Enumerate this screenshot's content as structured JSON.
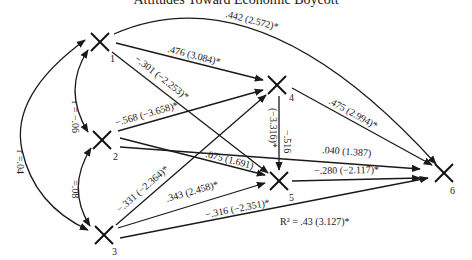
{
  "title": "Attitudes Toward Economic Boycott",
  "nodes": [
    {
      "id": "1",
      "label": "1",
      "x": 100,
      "y": 42
    },
    {
      "id": "2",
      "label": "2",
      "x": 102,
      "y": 140
    },
    {
      "id": "3",
      "label": "3",
      "x": 104,
      "y": 235
    },
    {
      "id": "4",
      "label": "4",
      "x": 277,
      "y": 85
    },
    {
      "id": "5",
      "label": "5",
      "x": 279,
      "y": 181
    },
    {
      "id": "6",
      "label": "6",
      "x": 444,
      "y": 173
    }
  ],
  "correlations": [
    {
      "from": "1",
      "to": "2",
      "label": "r = −.06"
    },
    {
      "from": "2",
      "to": "3",
      "label": "=.08"
    },
    {
      "from": "1",
      "to": "3",
      "label": "r =.04"
    }
  ],
  "paths": [
    {
      "from": "1",
      "to": "6",
      "label": ".442 (2.572)*"
    },
    {
      "from": "1",
      "to": "4",
      "label": ".476 (3.084)*"
    },
    {
      "from": "1",
      "to": "5",
      "label": "−.301 (−2.253)*"
    },
    {
      "from": "2",
      "to": "4",
      "label": "−.568 (−3.658)*"
    },
    {
      "from": "2",
      "to": "5",
      "label": ".075 (1.691)"
    },
    {
      "from": "2",
      "to": "6",
      "label": ".040 (1.387)"
    },
    {
      "from": "3",
      "to": "4",
      "label": "−.331 (−2.364)*"
    },
    {
      "from": "3",
      "to": "5",
      "label": ".343 (2.458)*"
    },
    {
      "from": "3",
      "to": "6",
      "label": "−.316 (−2.351)*"
    },
    {
      "from": "4",
      "to": "5",
      "label_top": "−.516",
      "label_bottom": "(−3.316)*"
    },
    {
      "from": "4",
      "to": "6",
      "label": ".475 (2.994)*"
    },
    {
      "from": "5",
      "to": "6",
      "label": "−.280 (−2.117)*"
    }
  ],
  "r_squared": "R² = .43 (3.127)*"
}
